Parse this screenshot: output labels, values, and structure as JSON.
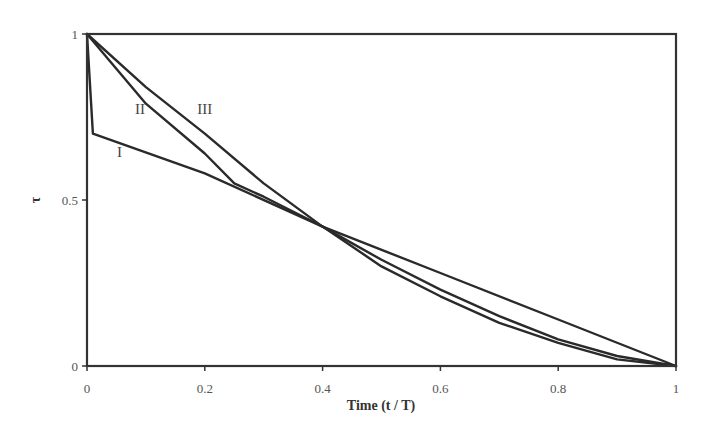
{
  "chart_data": {
    "type": "line",
    "title": "",
    "xlabel": "Time (t / T)",
    "ylabel": "τ",
    "xlim": [
      0,
      1
    ],
    "ylim": [
      0,
      1
    ],
    "grid": false,
    "legend": "none (inline curve labels)",
    "x_ticks": [
      "0",
      "0.2",
      "0.4",
      "0.6",
      "0.8",
      "1"
    ],
    "x_tick_values": [
      0,
      0.2,
      0.4,
      0.6,
      0.8,
      1
    ],
    "y_ticks": [
      "0",
      "0.5",
      "1"
    ],
    "y_tick_values": [
      0,
      0.5,
      1
    ],
    "series": [
      {
        "name": "I",
        "label_pos": [
          0.055,
          0.63
        ],
        "points": [
          [
            0,
            1
          ],
          [
            0.01,
            0.7
          ],
          [
            0.2,
            0.58
          ],
          [
            0.4,
            0.42
          ],
          [
            0.6,
            0.28
          ],
          [
            0.8,
            0.14
          ],
          [
            1,
            0
          ]
        ]
      },
      {
        "name": "II",
        "label_pos": [
          0.09,
          0.76
        ],
        "points": [
          [
            0,
            1
          ],
          [
            0.1,
            0.79
          ],
          [
            0.2,
            0.64
          ],
          [
            0.25,
            0.55
          ],
          [
            0.3,
            0.51
          ],
          [
            0.4,
            0.42
          ],
          [
            0.5,
            0.3
          ],
          [
            0.6,
            0.21
          ],
          [
            0.7,
            0.13
          ],
          [
            0.8,
            0.07
          ],
          [
            0.9,
            0.02
          ],
          [
            1,
            0
          ]
        ]
      },
      {
        "name": "III",
        "label_pos": [
          0.2,
          0.76
        ],
        "points": [
          [
            0,
            1
          ],
          [
            0.1,
            0.84
          ],
          [
            0.2,
            0.7
          ],
          [
            0.3,
            0.55
          ],
          [
            0.4,
            0.42
          ],
          [
            0.5,
            0.32
          ],
          [
            0.6,
            0.23
          ],
          [
            0.7,
            0.15
          ],
          [
            0.8,
            0.08
          ],
          [
            0.9,
            0.03
          ],
          [
            1,
            0
          ]
        ]
      }
    ]
  },
  "labels": {
    "xlabel": "Time (t / T)",
    "ylabel": "τ",
    "curve_I": "I",
    "curve_II": "II",
    "curve_III": "III"
  },
  "colors": {
    "line": "#2a2a2a",
    "frame": "#333333",
    "background": "#ffffff"
  }
}
